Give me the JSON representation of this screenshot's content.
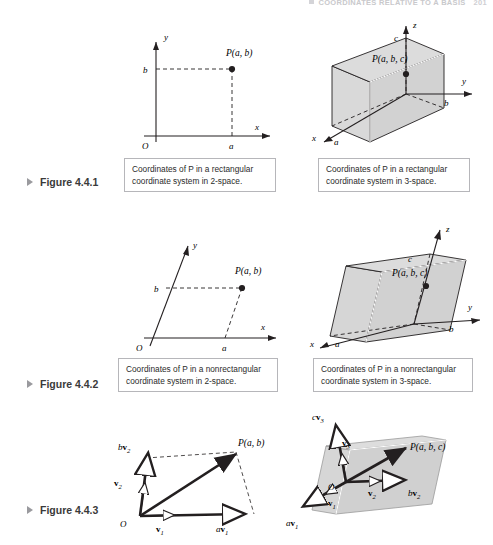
{
  "page": {
    "running_head": "COORDINATES RELATIVE TO A BASIS",
    "page_number": "201",
    "background": "#ffffff",
    "shade_color": "#d9d9d9",
    "line_color": "#231f20"
  },
  "figures": [
    {
      "id": "4.4.1",
      "label": "Figure 4.4.1",
      "panels": [
        {
          "kind": "2d-rectangular",
          "caption_line1": "Coordinates of P in a rectangular",
          "caption_line2": "coordinate system in 2-space.",
          "caption_italic_token": "P",
          "labels": {
            "origin": "O",
            "x_axis": "x",
            "y_axis": "y",
            "a": "a",
            "b": "b",
            "point": "P(a, b)"
          }
        },
        {
          "kind": "3d-rectangular",
          "caption_line1": "Coordinates of P in a rectangular",
          "caption_line2": "coordinate system in 3-space.",
          "caption_italic_token": "P",
          "labels": {
            "x_axis": "x",
            "y_axis": "y",
            "z_axis": "z",
            "a": "a",
            "b": "b",
            "c": "c",
            "point": "P(a, b, c)"
          }
        }
      ]
    },
    {
      "id": "4.4.2",
      "label": "Figure 4.4.2",
      "panels": [
        {
          "kind": "2d-nonrectangular",
          "caption_line1": "Coordinates of P in a nonrectangular",
          "caption_line2": "coordinate system in 2-space.",
          "caption_italic_token": "P",
          "labels": {
            "origin": "O",
            "x_axis": "x",
            "y_axis": "y",
            "a": "a",
            "b": "b",
            "point": "P(a, b)"
          }
        },
        {
          "kind": "3d-nonrectangular",
          "caption_line1": "Coordinates of P in a nonrectangular",
          "caption_line2": "coordinate system in 3-space.",
          "caption_italic_token": "P",
          "labels": {
            "x_axis": "x",
            "y_axis": "y",
            "z_axis": "z",
            "a": "a",
            "b": "b",
            "c": "c",
            "point": "P(a, b, c)"
          }
        }
      ]
    },
    {
      "id": "4.4.3",
      "label": "Figure 4.4.3",
      "panels": [
        {
          "kind": "2d-basis-vectors",
          "labels": {
            "origin": "O",
            "v1": "v",
            "v1_sub": "1",
            "v2": "v",
            "v2_sub": "2",
            "av1_scalar": "a",
            "bv2_scalar": "b",
            "point": "P(a, b)"
          }
        },
        {
          "kind": "3d-basis-vectors",
          "labels": {
            "origin": "O",
            "v1": "v",
            "v1_sub": "1",
            "v2": "v",
            "v2_sub": "2",
            "v3": "v",
            "v3_sub": "3",
            "av1_scalar": "a",
            "bv2_scalar": "b",
            "cv3_scalar": "c",
            "point": "P(a, b, c)"
          }
        }
      ]
    }
  ]
}
